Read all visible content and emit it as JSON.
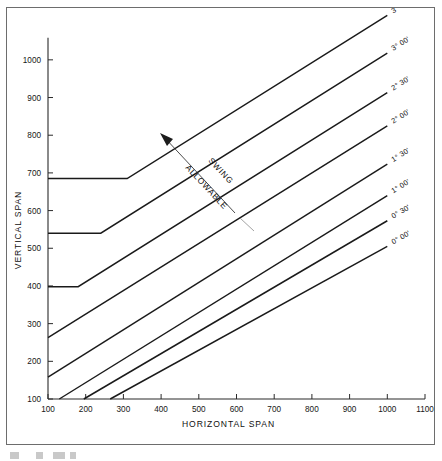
{
  "figure": {
    "background_color": "#ffffff",
    "frame_color": "#6d6d6d",
    "curve_color": "#1a1a1a"
  },
  "annotation": {
    "line1": "SWING",
    "line2": "ALLOWABLE"
  },
  "chart_data": {
    "type": "line",
    "title": "",
    "xlabel": "HORIZONTAL SPAN",
    "ylabel": "VERTICAL SPAN",
    "xlim": [
      100,
      1100
    ],
    "ylim": [
      100,
      1050
    ],
    "xticks": [
      100,
      200,
      300,
      400,
      500,
      600,
      700,
      800,
      900,
      1000,
      1100
    ],
    "yticks": [
      100,
      200,
      300,
      400,
      500,
      600,
      700,
      800,
      900,
      1000
    ],
    "xticklabels": [
      "100",
      "200",
      "300",
      "400",
      "500",
      "600",
      "700",
      "800",
      "900",
      "1000",
      "1100"
    ],
    "yticklabels": [
      "100",
      "200",
      "300",
      "400",
      "500",
      "600",
      "700",
      "800",
      "900",
      "1000"
    ],
    "grid": false,
    "legend": "inline-right-labels",
    "series": [
      {
        "name": "3° 30'",
        "label": "3° 30'",
        "x": [
          100,
          310,
          1000
        ],
        "y": [
          685,
          685,
          1118
        ]
      },
      {
        "name": "3° 00'",
        "label": "3° 00'",
        "x": [
          100,
          240,
          1000
        ],
        "y": [
          540,
          540,
          1018
        ]
      },
      {
        "name": "2° 30'",
        "label": "2° 30'",
        "x": [
          100,
          180,
          1000
        ],
        "y": [
          398,
          398,
          913
        ]
      },
      {
        "name": "2° 00'",
        "label": "2° 00'",
        "x": [
          100,
          1000
        ],
        "y": [
          263,
          825
        ]
      },
      {
        "name": "1° 30'",
        "label": "1° 30'",
        "x": [
          100,
          1000
        ],
        "y": [
          158,
          723
        ]
      },
      {
        "name": "1° 00'",
        "label": "1° 00'",
        "x": [
          130,
          1000
        ],
        "y": [
          100,
          640
        ]
      },
      {
        "name": "0° 30'",
        "label": "0° 30'",
        "x": [
          195,
          1000
        ],
        "y": [
          100,
          573
        ]
      },
      {
        "name": "0° 00'",
        "label": "0° 00'",
        "x": [
          265,
          1000
        ],
        "y": [
          100,
          505
        ]
      }
    ]
  }
}
